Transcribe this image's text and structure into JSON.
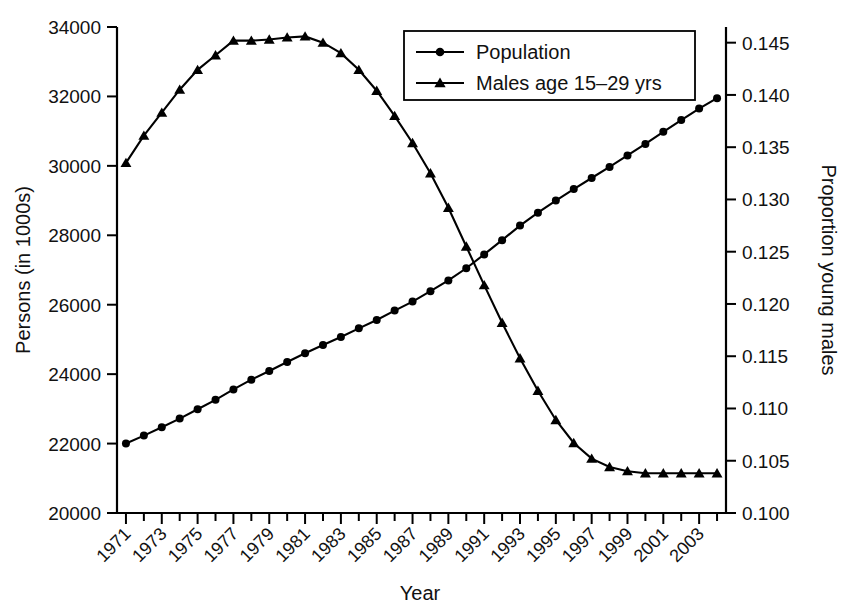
{
  "chart_data": {
    "type": "line",
    "title": "",
    "xlabel": "Year",
    "ylabel": "Persons (in 1000s)",
    "y2label": "Proportion young males",
    "xlim": [
      1970.5,
      2004.5
    ],
    "ylim": [
      20000,
      34000
    ],
    "y2lim": [
      0.1,
      0.1465
    ],
    "grid": false,
    "legend_position": "top-center",
    "xticks_major": [
      1971,
      1973,
      1975,
      1977,
      1979,
      1981,
      1983,
      1985,
      1987,
      1989,
      1991,
      1993,
      1995,
      1997,
      1999,
      2001,
      2003
    ],
    "xticklabels": [
      "1971",
      "1973",
      "1975",
      "1977",
      "1979",
      "1981",
      "1983",
      "1985",
      "1987",
      "1989",
      "1991",
      "1993",
      "1995",
      "1997",
      "1999",
      "2001",
      "2003"
    ],
    "xticks_all": [
      1971,
      1972,
      1973,
      1974,
      1975,
      1976,
      1977,
      1978,
      1979,
      1980,
      1981,
      1982,
      1983,
      1984,
      1985,
      1986,
      1987,
      1988,
      1989,
      1990,
      1991,
      1992,
      1993,
      1994,
      1995,
      1996,
      1997,
      1998,
      1999,
      2000,
      2001,
      2002,
      2003,
      2004
    ],
    "yticks": [
      20000,
      22000,
      24000,
      26000,
      28000,
      30000,
      32000,
      34000
    ],
    "yticklabels": [
      "20000",
      "22000",
      "24000",
      "26000",
      "28000",
      "30000",
      "32000",
      "34000"
    ],
    "y2ticks": [
      0.1,
      0.105,
      0.11,
      0.115,
      0.12,
      0.125,
      0.13,
      0.135,
      0.14,
      0.145
    ],
    "y2ticklabels": [
      "0.100",
      "0.105",
      "0.110",
      "0.115",
      "0.120",
      "0.125",
      "0.130",
      "0.135",
      "0.140",
      "0.145"
    ],
    "x": [
      1971,
      1972,
      1973,
      1974,
      1975,
      1976,
      1977,
      1978,
      1979,
      1980,
      1981,
      1982,
      1983,
      1984,
      1985,
      1986,
      1987,
      1988,
      1989,
      1990,
      1991,
      1992,
      1993,
      1994,
      1995,
      1996,
      1997,
      1998,
      1999,
      2000,
      2001,
      2002,
      2003,
      2004
    ],
    "series": [
      {
        "name": "Population",
        "axis": "left",
        "marker": "circle",
        "color": "#000000",
        "values": [
          22000,
          22230,
          22470,
          22720,
          22990,
          23260,
          23560,
          23840,
          24090,
          24350,
          24600,
          24840,
          25070,
          25320,
          25560,
          25830,
          26090,
          26390,
          26700,
          27050,
          27450,
          27860,
          28280,
          28650,
          29000,
          29330,
          29650,
          29970,
          30300,
          30630,
          30980,
          31320,
          31650,
          31950
        ]
      },
      {
        "name": "Males age 15–29 yrs",
        "axis": "right",
        "marker": "triangle",
        "color": "#000000",
        "values": [
          0.1335,
          0.1361,
          0.1383,
          0.1405,
          0.1424,
          0.1438,
          0.1452,
          0.1452,
          0.1453,
          0.1455,
          0.1456,
          0.145,
          0.144,
          0.1424,
          0.1404,
          0.138,
          0.1354,
          0.1325,
          0.1292,
          0.1255,
          0.1218,
          0.1182,
          0.1148,
          0.1117,
          0.1089,
          0.1067,
          0.1052,
          0.1044,
          0.104,
          0.1038,
          0.1038,
          0.1038,
          0.1038,
          0.1038
        ]
      }
    ],
    "legend": [
      {
        "label": "Population",
        "marker": "circle"
      },
      {
        "label": "Males age 15–29 yrs",
        "marker": "triangle"
      }
    ]
  }
}
